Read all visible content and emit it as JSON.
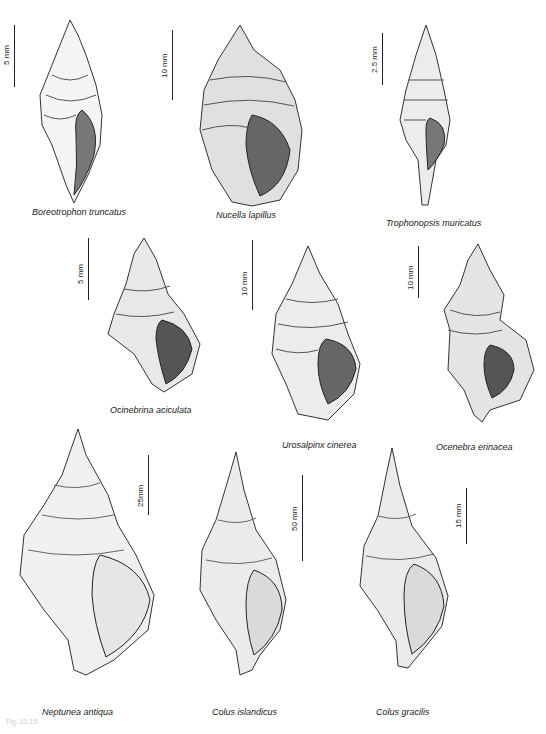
{
  "plate": {
    "background": "#ffffff",
    "ink": "#222222",
    "footer_text": "Fig. 10.15"
  },
  "specimens": [
    {
      "name": "Boreotrophon truncatus",
      "scale": "5 mm"
    },
    {
      "name": "Nucella lapillus",
      "scale": "10 mm"
    },
    {
      "name": "Trophonopsis muricatus",
      "scale": "2.5 mm"
    },
    {
      "name": "Ocinebrina aciculata",
      "scale": "5 mm"
    },
    {
      "name": "Urosalpinx cinerea",
      "scale": "10 mm"
    },
    {
      "name": "Ocenebra erinacea",
      "scale": "10 mm"
    },
    {
      "name": "Neptunea antiqua",
      "scale": "25mm"
    },
    {
      "name": "Colus islandicus",
      "scale": "50 mm"
    },
    {
      "name": "Colus gracilis",
      "scale": "15 mm"
    }
  ]
}
